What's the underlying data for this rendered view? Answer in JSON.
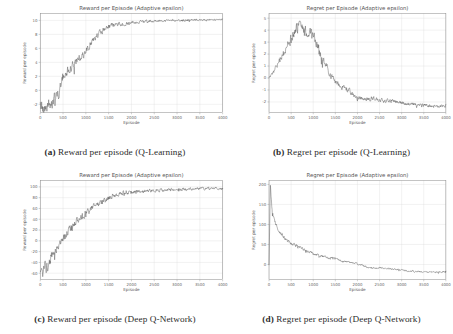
{
  "figure": {
    "name": "rl-training-curves-figure",
    "line_color": "#4a4a4a",
    "grid_color": "#d8d8d8",
    "background": "#ffffff"
  },
  "panels": [
    {
      "id": "a",
      "caption_label": "(a)",
      "caption_text": "Reward per episode (Q-Learning)",
      "chart_data": {
        "type": "line",
        "title": "Reward per Episode (Adaptive epsilon)",
        "xlabel": "Episode",
        "ylabel": "Reward per episode",
        "xlim": [
          0,
          4000
        ],
        "ylim": [
          -3.2,
          11.0
        ],
        "xticks": [
          0,
          500,
          1000,
          1500,
          2000,
          2500,
          3000,
          3500,
          4000
        ],
        "yticks": [
          -2,
          0,
          2,
          4,
          6,
          8,
          10
        ],
        "grid": true,
        "legend": "none",
        "series": [
          {
            "name": "reward",
            "x": [
              0,
              50,
              100,
              150,
              200,
              250,
              300,
              350,
              400,
              450,
              500,
              600,
              700,
              800,
              900,
              1000,
              1100,
              1200,
              1300,
              1400,
              1500,
              1600,
              1700,
              1800,
              1900,
              2000,
              2200,
              2400,
              2600,
              2800,
              3000,
              3200,
              3400,
              3600,
              3800,
              4000
            ],
            "values": [
              -1.4,
              -2.1,
              -2.6,
              -2.3,
              -1.7,
              -1.9,
              -1.2,
              -0.4,
              -0.9,
              0.6,
              1.9,
              2.8,
              3.4,
              4.3,
              4.6,
              5.6,
              6.6,
              7.4,
              8.2,
              8.7,
              9.1,
              9.3,
              9.4,
              9.5,
              9.6,
              9.7,
              9.8,
              9.9,
              9.9,
              10.0,
              10.0,
              10.0,
              10.1,
              10.1,
              10.1,
              10.1
            ],
            "noise": [
              0.85,
              0.85,
              0.8,
              0.78,
              0.75,
              0.7,
              0.68,
              0.66,
              0.62,
              0.6,
              0.58,
              0.56,
              0.54,
              0.5,
              0.48,
              0.45,
              0.42,
              0.4,
              0.36,
              0.33,
              0.3,
              0.28,
              0.26,
              0.24,
              0.22,
              0.2,
              0.18,
              0.17,
              0.16,
              0.15,
              0.14,
              0.13,
              0.12,
              0.11,
              0.1,
              0.1
            ]
          }
        ]
      }
    },
    {
      "id": "b",
      "caption_label": "(b)",
      "caption_text": "Regret per episode (Q-Learning)",
      "chart_data": {
        "type": "line",
        "title": "Regret per Episode (Adaptive epsilon)",
        "xlabel": "Episode",
        "ylabel": "Regret per episode",
        "xlim": [
          0,
          4000
        ],
        "ylim": [
          -2.9,
          5.4
        ],
        "xticks": [
          0,
          500,
          1000,
          1500,
          2000,
          2500,
          3000,
          3500,
          4000
        ],
        "yticks": [
          -2,
          -1,
          0,
          1,
          2,
          3,
          4,
          5
        ],
        "grid": true,
        "legend": "none",
        "series": [
          {
            "name": "regret",
            "x": [
              0,
              100,
              200,
              300,
              400,
              500,
              600,
              700,
              800,
              900,
              1000,
              1100,
              1200,
              1300,
              1400,
              1500,
              1600,
              1700,
              1800,
              1900,
              2000,
              2200,
              2400,
              2600,
              2800,
              3000,
              3200,
              3400,
              3600,
              3800,
              4000
            ],
            "values": [
              0.0,
              0.5,
              1.2,
              1.9,
              2.6,
              3.3,
              4.1,
              4.5,
              3.9,
              4.0,
              3.6,
              2.8,
              1.6,
              0.9,
              0.2,
              -0.3,
              -0.6,
              -0.9,
              -1.0,
              -1.4,
              -1.7,
              -1.8,
              -1.7,
              -1.9,
              -1.9,
              -2.1,
              -2.2,
              -2.2,
              -2.3,
              -2.4,
              -2.3
            ],
            "noise": [
              0.05,
              0.12,
              0.18,
              0.24,
              0.3,
              0.34,
              0.36,
              0.4,
              0.38,
              0.36,
              0.34,
              0.3,
              0.28,
              0.26,
              0.24,
              0.22,
              0.2,
              0.2,
              0.18,
              0.17,
              0.16,
              0.15,
              0.15,
              0.14,
              0.14,
              0.13,
              0.12,
              0.12,
              0.11,
              0.1,
              0.1
            ]
          }
        ]
      }
    },
    {
      "id": "c",
      "caption_label": "(c)",
      "caption_text": "Reward per episode (Deep Q-Network)",
      "chart_data": {
        "type": "line",
        "title": "Reward per Episode (Adaptive epsilon)",
        "xlabel": "Episode",
        "ylabel": "Reward per episode",
        "xlim": [
          0,
          4000
        ],
        "ylim": [
          -72,
          112
        ],
        "xticks": [
          0,
          500,
          1000,
          1500,
          2000,
          2500,
          3000,
          3500,
          4000
        ],
        "yticks": [
          -60,
          -40,
          -20,
          0,
          20,
          40,
          60,
          80,
          100
        ],
        "grid": true,
        "legend": "none",
        "series": [
          {
            "name": "reward",
            "x": [
              0,
              50,
              100,
              150,
              200,
              250,
              300,
              400,
              500,
              600,
              700,
              800,
              900,
              1000,
              1100,
              1200,
              1300,
              1400,
              1500,
              1600,
              1800,
              2000,
              2200,
              2400,
              2600,
              2800,
              3000,
              3200,
              3400,
              3600,
              3800,
              4000
            ],
            "values": [
              -55,
              -63,
              -48,
              -52,
              -38,
              -30,
              -22,
              -8,
              4,
              16,
              26,
              36,
              44,
              52,
              60,
              66,
              68,
              74,
              79,
              83,
              88,
              91,
              92,
              93,
              94,
              95,
              95,
              96,
              96,
              97,
              97,
              97
            ],
            "noise": [
              9,
              9,
              9,
              8.5,
              8,
              7.5,
              7,
              6.5,
              6,
              6,
              5.6,
              5.4,
              5.2,
              5,
              4.8,
              4.6,
              4.4,
              4.2,
              4,
              3.8,
              3.4,
              3.2,
              3,
              2.8,
              2.7,
              2.6,
              2.5,
              2.4,
              2.3,
              2.2,
              2.1,
              2
            ]
          }
        ]
      }
    },
    {
      "id": "d",
      "caption_label": "(d)",
      "caption_text": "Regret per episode (Deep Q-Network)",
      "chart_data": {
        "type": "line",
        "title": "Regret per Episode (Adaptive epsilon)",
        "xlabel": "Episode",
        "ylabel": "Regret per episode",
        "xlim": [
          0,
          4000
        ],
        "ylim": [
          -38,
          210
        ],
        "xticks": [
          0,
          500,
          1000,
          1500,
          2000,
          2500,
          3000,
          3500,
          4000
        ],
        "yticks": [
          0,
          50,
          100,
          150,
          200
        ],
        "grid": true,
        "legend": "none",
        "series": [
          {
            "name": "regret",
            "x": [
              0,
              30,
              60,
              90,
              120,
              160,
              200,
              260,
              320,
              400,
              500,
              600,
              700,
              800,
              900,
              1000,
              1100,
              1200,
              1300,
              1400,
              1500,
              1600,
              1800,
              2000,
              2200,
              2400,
              2600,
              2800,
              3000,
              3200,
              3400,
              3600,
              3800,
              4000
            ],
            "values": [
              0,
              198,
              150,
              120,
              105,
              96,
              88,
              78,
              70,
              62,
              52,
              46,
              42,
              36,
              32,
              28,
              24,
              20,
              18,
              17,
              14,
              10,
              6,
              2,
              -6,
              -10,
              -8,
              -12,
              -14,
              -16,
              -18,
              -19,
              -20,
              -17
            ],
            "noise": [
              1,
              3,
              6,
              6,
              6,
              5.5,
              5,
              4.6,
              4.2,
              4,
              3.8,
              3.6,
              3.4,
              3.2,
              3,
              2.8,
              2.8,
              2.6,
              2.6,
              2.5,
              2.4,
              2.3,
              2.2,
              2.1,
              2,
              2,
              2,
              1.9,
              1.9,
              1.8,
              1.8,
              1.7,
              1.7,
              1.6
            ]
          }
        ]
      }
    }
  ]
}
